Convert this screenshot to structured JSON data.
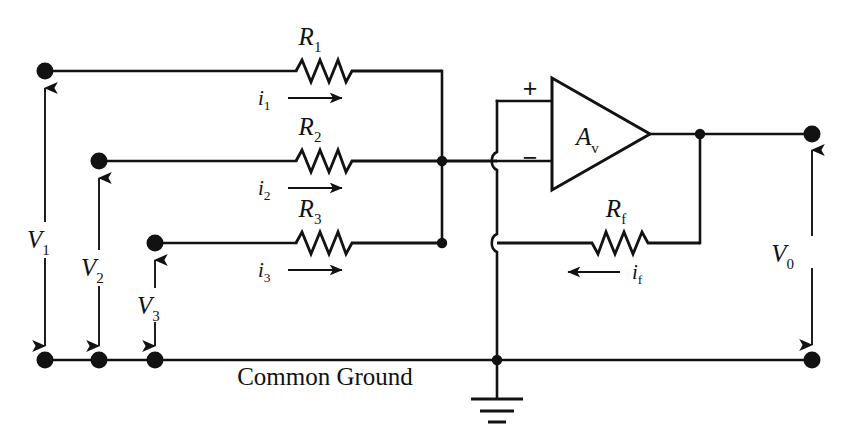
{
  "figure": {
    "ground_label": "Common Ground",
    "background_color": "#ffffff",
    "ink_color": "#121212"
  },
  "amplifier": {
    "gain_label": "A",
    "gain_sub": "v",
    "plus_label": "+",
    "minus_label": "−"
  },
  "resistors": [
    {
      "name": "R1",
      "label": "R",
      "sub": "1"
    },
    {
      "name": "R2",
      "label": "R",
      "sub": "2"
    },
    {
      "name": "R3",
      "label": "R",
      "sub": "3"
    },
    {
      "name": "Rf",
      "label": "R",
      "sub": "f"
    }
  ],
  "currents": [
    {
      "name": "i1",
      "label": "i",
      "sub": "1",
      "direction": "right"
    },
    {
      "name": "i2",
      "label": "i",
      "sub": "2",
      "direction": "right"
    },
    {
      "name": "i3",
      "label": "i",
      "sub": "3",
      "direction": "right"
    },
    {
      "name": "if",
      "label": "i",
      "sub": "f",
      "direction": "left"
    }
  ],
  "voltages": [
    {
      "name": "V1",
      "label": "V",
      "sub": "1"
    },
    {
      "name": "V2",
      "label": "V",
      "sub": "2"
    },
    {
      "name": "V3",
      "label": "V",
      "sub": "3"
    },
    {
      "name": "V0",
      "label": "V",
      "sub": "0"
    }
  ]
}
